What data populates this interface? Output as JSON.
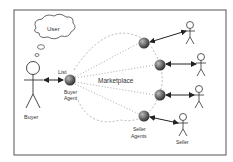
{
  "diagram": {
    "cloud_text": "User",
    "list_label": "List",
    "marketplace_label": "Marketplace",
    "buyer_agent_label_1": "Buyer",
    "buyer_agent_label_2": "Agent",
    "buyer_label": "Buyer",
    "seller_agents_label_1": "Seller",
    "seller_agents_label_2": "Agents",
    "seller_label": "Seller"
  },
  "colors": {
    "frame": "#555555",
    "agent": "#5a5a5a",
    "line": "#222222",
    "dotted": "#999999"
  }
}
